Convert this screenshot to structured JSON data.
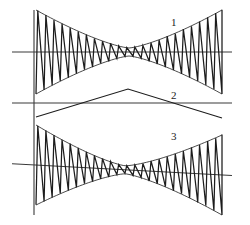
{
  "figure": {
    "kind": "waveform-diagram",
    "background_color": "#ffffff",
    "line_color": "#1c1c1c",
    "axis_color": "#3a3a3a",
    "width": 250,
    "height": 225,
    "trace_labels": [
      {
        "text": "1",
        "x": 171,
        "y": 26
      },
      {
        "text": "2",
        "x": 171,
        "y": 99
      },
      {
        "text": "3",
        "x": 171,
        "y": 140
      }
    ]
  },
  "chart_data": {
    "type": "line",
    "title": "",
    "xlabel": "",
    "ylabel": "",
    "grid": false,
    "legend_position": "inline-right",
    "axes": {
      "vertical_axis_x": 34,
      "vertical_axis_y0": 10,
      "vertical_axis_y1": 215,
      "x_start": 36,
      "x_end": 222,
      "axis_extend_right": 232
    },
    "series": [
      {
        "name": "1",
        "label": "1",
        "kind": "amplitude-modulated-sawtooth",
        "baseline_y": 52,
        "baseline_tilt": 0,
        "baseline_x0": 12,
        "baseline_x1": 232,
        "amplitude_max": 42,
        "amplitude_min": 4,
        "cycles": 23,
        "waist_x_fraction": 0.5,
        "sawtooth_rise_fraction": 0.22,
        "envelope": "double-taper",
        "x_start": 36,
        "x_end": 222
      },
      {
        "name": "2",
        "label": "2",
        "kind": "triangle-envelope",
        "baseline_y": 103,
        "baseline_x0": 12,
        "baseline_x1": 232,
        "amplitude": 14,
        "cycles": 1,
        "peak_x": 128,
        "left_y": 117,
        "right_y": 118,
        "x_start": 36,
        "x_end": 222
      },
      {
        "name": "3",
        "label": "3",
        "kind": "amplitude-modulated-sawtooth",
        "baseline_y": 170,
        "baseline_tilt": 10,
        "baseline_x0": 12,
        "baseline_x1": 232,
        "amplitude_max": 40,
        "amplitude_min": 4,
        "cycles": 23,
        "waist_x_fraction": 0.48,
        "sawtooth_rise_fraction": 0.22,
        "envelope": "double-taper",
        "x_start": 36,
        "x_end": 222
      }
    ]
  }
}
